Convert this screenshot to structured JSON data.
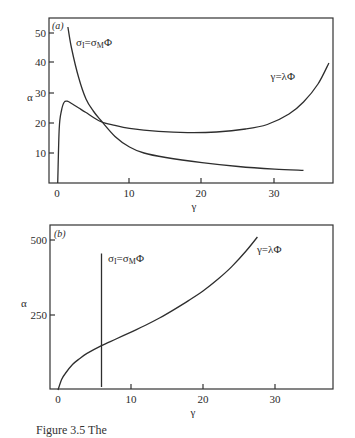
{
  "chart_data": [
    {
      "type": "line",
      "panel": "(a)",
      "xlabel": "γ",
      "ylabel": "α",
      "xlim": [
        -1,
        38
      ],
      "ylim": [
        0,
        55
      ],
      "xticks": [
        0,
        10,
        20,
        30
      ],
      "yticks": [
        10,
        20,
        30,
        40,
        50
      ],
      "grid": false,
      "series": [
        {
          "name": "σ_I=σ_MΦ",
          "label": "σ",
          "label_sub1": "I",
          "label_mid": "=σ",
          "label_sub2": "M",
          "label_end": "Φ",
          "x": [
            1.5,
            2,
            3,
            4,
            5,
            6,
            8,
            10,
            12,
            15,
            20,
            25,
            30,
            34
          ],
          "y": [
            52,
            45,
            35,
            28,
            24,
            21,
            15.5,
            12,
            10,
            8.5,
            6.8,
            5.5,
            4.6,
            4.2
          ]
        },
        {
          "name": "γ=λΦ",
          "label": "γ=λΦ",
          "x": [
            0.1,
            0.3,
            0.6,
            1,
            1.5,
            2,
            3,
            4,
            6,
            8,
            10,
            14,
            18,
            22,
            26,
            29,
            32,
            34,
            36,
            37.5
          ],
          "y": [
            0,
            18,
            24,
            27,
            27.2,
            26.5,
            25,
            23.5,
            20.5,
            19.2,
            18.2,
            17.2,
            16.8,
            17,
            18,
            19.5,
            23,
            27,
            33,
            40
          ]
        }
      ]
    },
    {
      "type": "line",
      "panel": "(b)",
      "xlabel": "γ",
      "ylabel": "α",
      "xlim": [
        -1,
        38
      ],
      "ylim": [
        0,
        550
      ],
      "xticks": [
        0,
        10,
        20,
        30
      ],
      "yticks": [
        250,
        500
      ],
      "grid": false,
      "series": [
        {
          "name": "σ_I=σ_MΦ",
          "label": "σ",
          "label_sub1": "I",
          "label_mid": "=σ",
          "label_sub2": "M",
          "label_end": "Φ",
          "x": [
            6,
            6
          ],
          "y": [
            10,
            455
          ]
        },
        {
          "name": "γ=λΦ",
          "label": "γ=λΦ",
          "x": [
            0,
            0.5,
            1,
            2,
            3,
            4,
            6,
            8,
            10,
            12,
            14,
            16,
            18,
            20,
            22,
            24,
            26,
            27.5
          ],
          "y": [
            0,
            35,
            55,
            85,
            105,
            122,
            148,
            170,
            192,
            215,
            240,
            268,
            298,
            330,
            368,
            412,
            465,
            510
          ]
        }
      ]
    }
  ],
  "caption": "Figure 3.5  The"
}
